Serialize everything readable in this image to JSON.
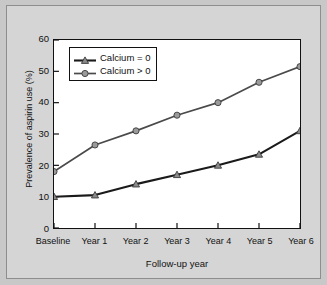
{
  "figure": {
    "background_color": "#d5d5d5",
    "plot_background_color": "#ffffff",
    "frame_color": "#8e8e8e"
  },
  "chart_data": {
    "type": "line",
    "title": "",
    "subtitle": "",
    "xlabel": "Follow-up year",
    "ylabel": "Prevalence of aspirin use (%)",
    "categories": [
      "Baseline",
      "Year 1",
      "Year 2",
      "Year 3",
      "Year 4",
      "Year 5",
      "Year 6"
    ],
    "series": [
      {
        "name": "Calcium = 0",
        "marker": "triangle",
        "color": "#1a1a1a",
        "marker_color": "#8a8a8a",
        "values": [
          10,
          10.5,
          14,
          17,
          20,
          23.5,
          31
        ]
      },
      {
        "name": "Calcium > 0",
        "marker": "circle",
        "color": "#4a4a4a",
        "marker_color": "#9a9a9a",
        "values": [
          18,
          26.5,
          31,
          36,
          40,
          46.5,
          51.5
        ]
      }
    ],
    "ylim": [
      0,
      60
    ],
    "yticks": [
      0,
      10,
      20,
      30,
      40,
      50,
      60
    ],
    "ytick_labels": [
      "0",
      "10",
      "20",
      "30",
      "40",
      "50",
      "60"
    ],
    "grid": false,
    "legend_position": "upper left",
    "legend_entries": [
      "Calcium = 0",
      "Calcium > 0"
    ]
  }
}
